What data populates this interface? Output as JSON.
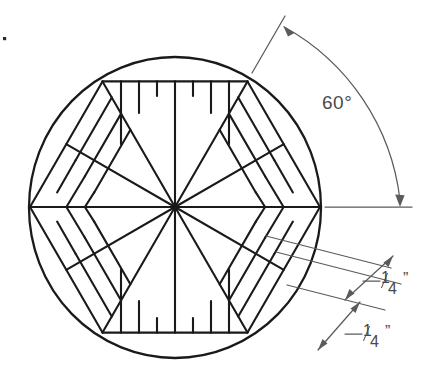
{
  "drawing": {
    "title": "Hexagonal segmented disc layout",
    "type": "engineering-line-drawing",
    "canvas": {
      "width": 424,
      "height": 392
    },
    "colors": {
      "object_line": "#1a1a1a",
      "dimension_line": "#5b5b5b",
      "background": "#ffffff",
      "text": "#4a4a4a"
    }
  },
  "geometry": {
    "circle": {
      "cx": 175,
      "cy": 207,
      "r": 150
    },
    "hexagon": {
      "cx": 175,
      "cy": 207,
      "circumradius": 145,
      "vertex_count": 6,
      "vertices_deg": [
        0,
        60,
        120,
        180,
        240,
        300
      ]
    },
    "spokes": {
      "count": 12,
      "note": "radial lines from center to 6 hexagon vertices and 6 edge midpoints"
    },
    "sectors": {
      "count": 12,
      "step_lines_per_sector": 3
    }
  },
  "dimensions": {
    "angle": {
      "label": "60°",
      "value": 60,
      "unit": "degrees",
      "type": "angular",
      "arrowheads": 2
    },
    "spacing_upper": {
      "label_whole": "",
      "numerator": "1",
      "denominator": "4",
      "unit_mark": "”",
      "value": 0.25,
      "unit": "inch",
      "type": "linear"
    },
    "spacing_lower": {
      "label_whole": "",
      "numerator": "1",
      "denominator": "4",
      "unit_mark": "”",
      "value": 0.25,
      "unit": "inch",
      "type": "linear"
    }
  },
  "artifacts": {
    "speck": {
      "x": 4,
      "y": 38,
      "size": 3
    }
  }
}
